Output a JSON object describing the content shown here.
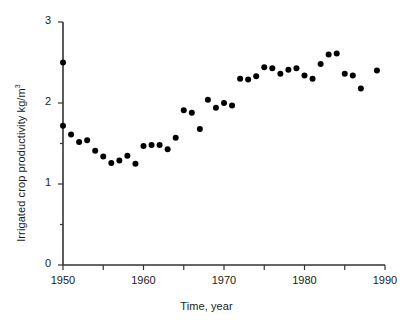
{
  "chart_data": {
    "type": "scatter",
    "title": "",
    "xlabel": "Time, year",
    "ylabel": "Irrigated crop productivity kg/m³",
    "ylabel_base": "Irrigated crop productivity kg/m",
    "ylabel_exponent": "3",
    "xlim": [
      1950,
      1990
    ],
    "ylim": [
      0,
      3
    ],
    "xticks": [
      1950,
      1955,
      1960,
      1965,
      1970,
      1975,
      1980,
      1985,
      1990
    ],
    "xtick_labels": [
      "1950",
      "",
      "1960",
      "",
      "1970",
      "",
      "1980",
      "",
      "1990"
    ],
    "yticks": [
      0,
      0.5,
      1,
      1.5,
      2,
      2.5,
      3
    ],
    "ytick_labels": [
      "0",
      "",
      "1",
      "",
      "2",
      "",
      "3"
    ],
    "grid": false,
    "legend": false,
    "marker": "filled-circle",
    "marker_color": "#000000",
    "marker_size_px": 6,
    "x": [
      1950,
      1950,
      1951,
      1952,
      1953,
      1954,
      1955,
      1956,
      1957,
      1958,
      1959,
      1960,
      1961,
      1962,
      1963,
      1964,
      1965,
      1966,
      1967,
      1968,
      1969,
      1970,
      1971,
      1972,
      1973,
      1974,
      1975,
      1976,
      1977,
      1978,
      1979,
      1980,
      1981,
      1982,
      1983,
      1984,
      1985,
      1986,
      1987,
      1989
    ],
    "y": [
      2.5,
      1.72,
      1.61,
      1.52,
      1.54,
      1.41,
      1.34,
      1.26,
      1.29,
      1.35,
      1.25,
      1.47,
      1.48,
      1.48,
      1.43,
      1.57,
      1.91,
      1.88,
      1.68,
      2.04,
      1.94,
      2.0,
      1.97,
      2.3,
      2.29,
      2.33,
      2.44,
      2.43,
      2.36,
      2.41,
      2.43,
      2.34,
      2.3,
      2.48,
      2.6,
      2.61,
      2.36,
      2.34,
      2.18,
      2.4
    ],
    "points": [
      {
        "x": 1950,
        "y": 2.5
      },
      {
        "x": 1950,
        "y": 1.72
      },
      {
        "x": 1951,
        "y": 1.61
      },
      {
        "x": 1952,
        "y": 1.52
      },
      {
        "x": 1953,
        "y": 1.54
      },
      {
        "x": 1954,
        "y": 1.41
      },
      {
        "x": 1955,
        "y": 1.34
      },
      {
        "x": 1956,
        "y": 1.26
      },
      {
        "x": 1957,
        "y": 1.29
      },
      {
        "x": 1958,
        "y": 1.35
      },
      {
        "x": 1959,
        "y": 1.25
      },
      {
        "x": 1960,
        "y": 1.47
      },
      {
        "x": 1961,
        "y": 1.48
      },
      {
        "x": 1962,
        "y": 1.48
      },
      {
        "x": 1963,
        "y": 1.43
      },
      {
        "x": 1964,
        "y": 1.57
      },
      {
        "x": 1965,
        "y": 1.91
      },
      {
        "x": 1966,
        "y": 1.88
      },
      {
        "x": 1967,
        "y": 1.68
      },
      {
        "x": 1968,
        "y": 2.04
      },
      {
        "x": 1969,
        "y": 1.94
      },
      {
        "x": 1970,
        "y": 2.0
      },
      {
        "x": 1971,
        "y": 1.97
      },
      {
        "x": 1972,
        "y": 2.3
      },
      {
        "x": 1973,
        "y": 2.29
      },
      {
        "x": 1974,
        "y": 2.33
      },
      {
        "x": 1975,
        "y": 2.44
      },
      {
        "x": 1976,
        "y": 2.43
      },
      {
        "x": 1977,
        "y": 2.36
      },
      {
        "x": 1978,
        "y": 2.41
      },
      {
        "x": 1979,
        "y": 2.43
      },
      {
        "x": 1980,
        "y": 2.34
      },
      {
        "x": 1981,
        "y": 2.3
      },
      {
        "x": 1982,
        "y": 2.48
      },
      {
        "x": 1983,
        "y": 2.6
      },
      {
        "x": 1984,
        "y": 2.61
      },
      {
        "x": 1985,
        "y": 2.36
      },
      {
        "x": 1986,
        "y": 2.34
      },
      {
        "x": 1987,
        "y": 2.18
      },
      {
        "x": 1989,
        "y": 2.4
      }
    ]
  },
  "geometry": {
    "x_px_min": 63,
    "x_px_max": 385,
    "y_px_min": 265,
    "y_px_max": 22,
    "tick_len_major": 5,
    "tick_len_minor": 3,
    "axis_color": "#333333"
  }
}
